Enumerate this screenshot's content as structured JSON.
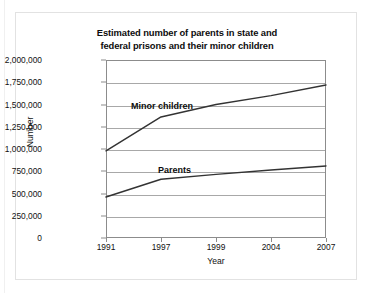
{
  "figure": {
    "title_line_1": "Estimated number of parents in state and",
    "title_line_2": "federal prisons and their minor children"
  },
  "chart_data": {
    "type": "line",
    "title": "Estimated number of parents in state and federal prisons and their minor children",
    "xlabel": "Year",
    "ylabel": "Number",
    "categories": [
      "1991",
      "1997",
      "1999",
      "2004",
      "2007"
    ],
    "ylim": [
      0,
      2000000
    ],
    "ytick_labels": [
      "0",
      "250,000",
      "500,000",
      "750,000",
      "1,000,000",
      "1,250,000",
      "1,500,000",
      "1,750,000",
      "2,000,000"
    ],
    "ytick_values": [
      0,
      250000,
      500000,
      750000,
      1000000,
      1250000,
      1500000,
      1750000,
      2000000
    ],
    "grid": true,
    "legend_position": "inline-labels",
    "series": [
      {
        "name": "Minor children",
        "values": [
          980000,
          1360000,
          1500000,
          1600000,
          1720000
        ],
        "color": "#333333"
      },
      {
        "name": "Parents",
        "values": [
          460000,
          660000,
          715000,
          765000,
          810000
        ],
        "color": "#333333"
      }
    ]
  }
}
